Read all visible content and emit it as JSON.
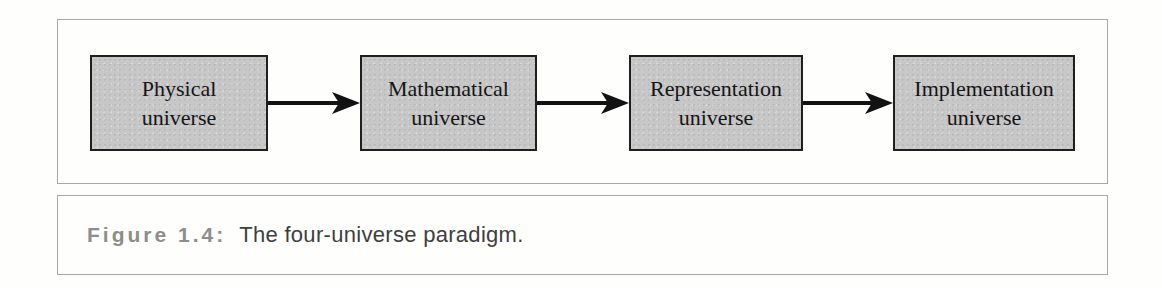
{
  "colors": {
    "background": "#fefefd",
    "panel_border": "#a8a8a8",
    "box_fill": "#c7c7c7",
    "box_border": "#1f1f1f",
    "box_text": "#151515",
    "arrow": "#121212",
    "caption_label_color": "#8d8d8d",
    "caption_text_color": "#3e3e3e"
  },
  "diagram": {
    "nodes": [
      {
        "line1": "Physical",
        "line2": "universe"
      },
      {
        "line1": "Mathematical",
        "line2": "universe"
      },
      {
        "line1": "Representation",
        "line2": "universe"
      },
      {
        "line1": "Implementation",
        "line2": "universe"
      }
    ]
  },
  "caption": {
    "label": "Figure 1.4:",
    "text": "The four-universe paradigm."
  }
}
